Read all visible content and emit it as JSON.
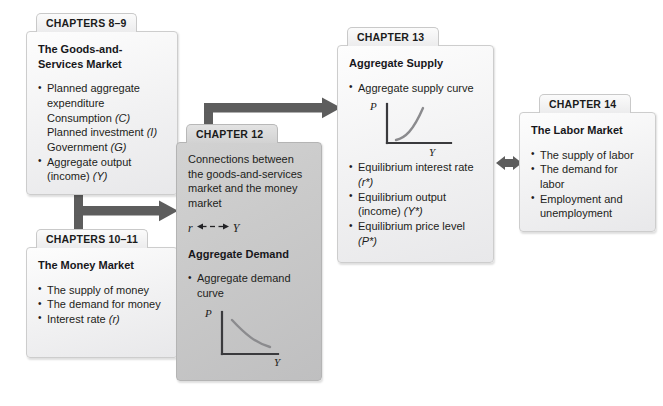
{
  "diagram": {
    "accent_color": "#5a5a5a",
    "card_bg": "#f1f1f2",
    "card_bg_dark": "#c8c8c9"
  },
  "cards": {
    "ch89": {
      "tab": "CHAPTERS 8–9",
      "title": "The Goods-and-Services Market",
      "bullets": [
        {
          "main": "Planned aggregate expenditure",
          "sub": [
            "Consumption (C)",
            "Planned investment (I)",
            "Government (G)"
          ]
        },
        {
          "main": "Aggregate output (income) (Y)",
          "sub": []
        }
      ]
    },
    "ch1011": {
      "tab": "CHAPTERS 10–11",
      "title": "The Money Market",
      "bullets": [
        "The supply of money",
        "The demand for money",
        "Interest rate (r)"
      ]
    },
    "ch12": {
      "tab": "CHAPTER 12",
      "text": "Connections between the goods-and-services market and the money market",
      "formula_left": "r",
      "formula_right": "Y",
      "subtitle": "Aggregate Demand",
      "bullets": [
        "Aggregate demand curve"
      ],
      "plot": {
        "type": "line",
        "name": "aggregate-demand-curve",
        "xlabel": "Y",
        "ylabel": "P",
        "shape": "downward-sloping convex"
      }
    },
    "ch13": {
      "tab": "CHAPTER 13",
      "title": "Aggregate Supply",
      "bullets_top": [
        "Aggregate supply curve"
      ],
      "plot": {
        "type": "line",
        "name": "aggregate-supply-curve",
        "xlabel": "Y",
        "ylabel": "P",
        "shape": "upward-sloping convex"
      },
      "bullets_bottom": [
        "Equilibrium interest rate (r*)",
        "Equilibrium output (income) (Y*)",
        "Equilibrium price level (P*)"
      ]
    },
    "ch14": {
      "tab": "CHAPTER 14",
      "title": "The Labor Market",
      "bullets": [
        "The supply of labor",
        "The demand for labor",
        "Employment and unemployment"
      ]
    }
  },
  "connectors": {
    "merge_to_ch12": "T-shaped arrow from Chapters 8–9 and Chapters 10–11 into Chapter 12",
    "ch12_to_ch13": "Elbow arrow from Chapter 12 up and right into Chapter 13",
    "ch13_ch14": "Double-headed arrow between Chapter 13 and Chapter 14"
  },
  "chart_data": [
    {
      "type": "line",
      "title": "Aggregate demand curve",
      "xlabel": "Y",
      "ylabel": "P",
      "series": [
        {
          "name": "AD",
          "x": [
            0.12,
            0.3,
            0.5,
            0.7,
            0.9
          ],
          "y": [
            0.92,
            0.66,
            0.46,
            0.33,
            0.26
          ]
        }
      ],
      "xlim": [
        0,
        1
      ],
      "ylim": [
        0,
        1
      ],
      "grid": false,
      "legend": "none"
    },
    {
      "type": "line",
      "title": "Aggregate supply curve",
      "xlabel": "Y",
      "ylabel": "P",
      "series": [
        {
          "name": "AS",
          "x": [
            0.15,
            0.35,
            0.55,
            0.75,
            0.92
          ],
          "y": [
            0.1,
            0.2,
            0.38,
            0.66,
            0.94
          ]
        }
      ],
      "xlim": [
        0,
        1
      ],
      "ylim": [
        0,
        1
      ],
      "grid": false,
      "legend": "none"
    }
  ]
}
